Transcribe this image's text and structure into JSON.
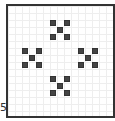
{
  "axis_label": "5",
  "board": {
    "cell_size": 7,
    "origin": {
      "x": 7,
      "y": 6
    },
    "cell_color": "#444444",
    "clusters": [
      {
        "name": "top",
        "col": 6,
        "row": 2
      },
      {
        "name": "left",
        "col": 2,
        "row": 6
      },
      {
        "name": "right",
        "col": 10,
        "row": 6
      },
      {
        "name": "bottom",
        "col": 6,
        "row": 10
      }
    ],
    "pattern": [
      [
        0,
        0
      ],
      [
        2,
        0
      ],
      [
        1,
        1
      ],
      [
        0,
        2
      ],
      [
        2,
        2
      ]
    ]
  }
}
